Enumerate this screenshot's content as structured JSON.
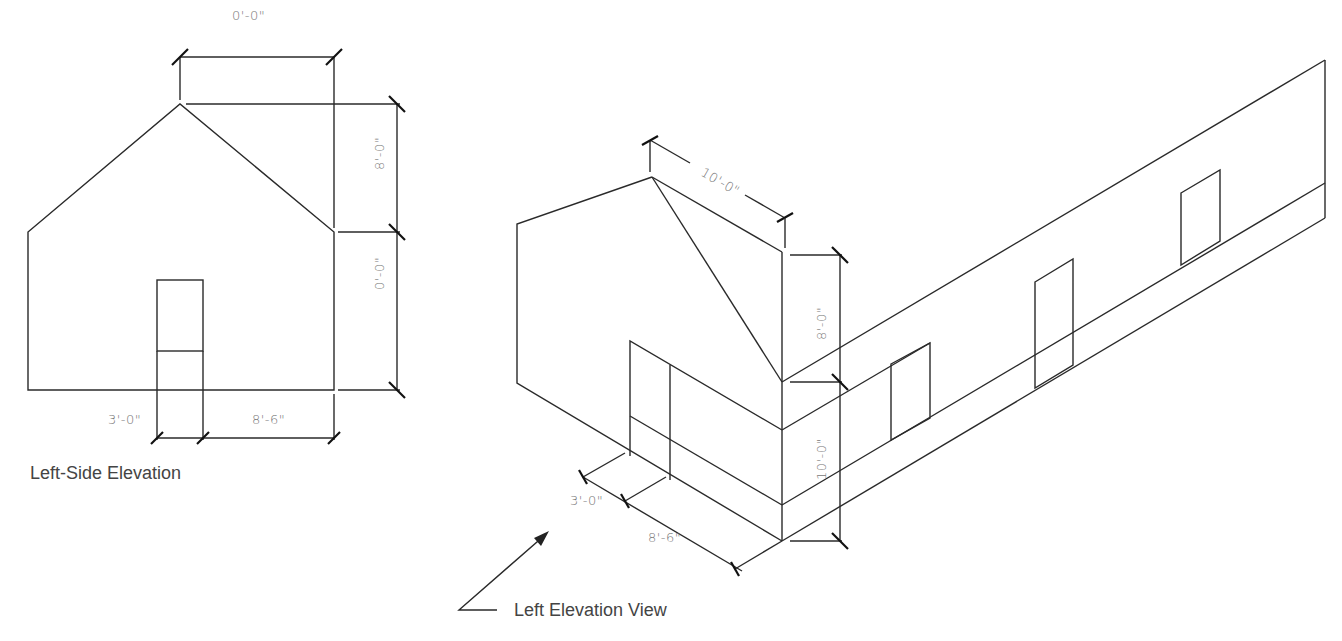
{
  "left_view": {
    "caption": "Left-Side Elevation",
    "dimensions": {
      "top_width": "0'-0\"",
      "upper_height": "8'-0\"",
      "lower_height": "0'-0\"",
      "door_width": "3'-0\"",
      "right_offset": "8'-6\""
    }
  },
  "iso_view": {
    "caption": "Left Elevation View",
    "dimensions": {
      "ridge_width": "10'-0\"",
      "upper_height": "8'-0\"",
      "lower_height": "10'-0\"",
      "door_width": "3'-0\"",
      "offset": "8'-6\""
    }
  },
  "colors": {
    "line": "#2a2a2a",
    "dimension_text": "#777777",
    "caption_text": "#444444"
  }
}
